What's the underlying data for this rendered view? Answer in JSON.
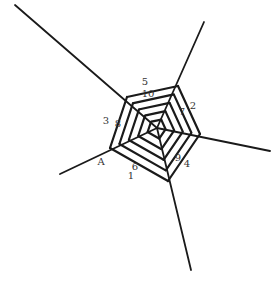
{
  "diagram": {
    "colors": {
      "line": "#1a1a1a",
      "label": "#333333",
      "background": "#ffffff"
    },
    "center": [
      157,
      128
    ],
    "rays": [
      {
        "name": "ray-top-left",
        "from": [
          157,
          128
        ],
        "to": [
          15,
          5
        ]
      },
      {
        "name": "ray-top-right",
        "from": [
          157,
          128
        ],
        "to": [
          204,
          22
        ]
      },
      {
        "name": "ray-right",
        "from": [
          157,
          128
        ],
        "to": [
          270,
          151
        ]
      },
      {
        "name": "ray-bottom",
        "from": [
          157,
          128
        ],
        "to": [
          191,
          270
        ]
      },
      {
        "name": "ray-bottom-left",
        "from": [
          157,
          128
        ],
        "to": [
          60,
          174
        ]
      }
    ],
    "outer_pentagon": [
      [
        127,
        97
      ],
      [
        178,
        86
      ],
      [
        200,
        134
      ],
      [
        168,
        181
      ],
      [
        110,
        148
      ]
    ],
    "rings": 5,
    "labels": [
      {
        "text": "5",
        "x": 145,
        "y": 85
      },
      {
        "text": "10",
        "x": 148,
        "y": 97
      },
      {
        "text": "2",
        "x": 193,
        "y": 109
      },
      {
        "text": "7",
        "x": 182,
        "y": 115
      },
      {
        "text": "3",
        "x": 106,
        "y": 124
      },
      {
        "text": "8",
        "x": 118,
        "y": 127
      },
      {
        "text": "9",
        "x": 178,
        "y": 161
      },
      {
        "text": "4",
        "x": 187,
        "y": 167
      },
      {
        "text": "A",
        "x": 101,
        "y": 165
      },
      {
        "text": "6",
        "x": 135,
        "y": 170
      },
      {
        "text": "1",
        "x": 131,
        "y": 179
      }
    ]
  }
}
